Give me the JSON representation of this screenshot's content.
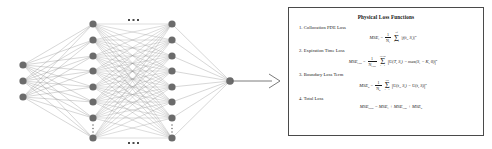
{
  "figure": {
    "caption_present": false
  },
  "network": {
    "name": "neural-network-architecture",
    "input_layer": {
      "label": "",
      "node_count": 3
    },
    "hidden_layers": [
      {
        "node_count": 8,
        "ellipsis_vertical": "⋮"
      },
      {
        "node_count": 8,
        "ellipsis_vertical": "⋮"
      }
    ],
    "hidden_ellipsis_top": "• • •",
    "hidden_ellipsis_bottom": "• • •",
    "output_layer": {
      "node_count": 1
    },
    "node_color": "#6b6b6b",
    "edge_color": "#8c8c8c",
    "arrow_color": "#5a5a5a"
  },
  "panel": {
    "title": "Physical Loss Functions",
    "border_color": "#4a4a4a",
    "items": [
      {
        "index": "1.",
        "label": "Collocation PDE Loss",
        "formula": {
          "lhs": "MSE",
          "lhs_sub": "f",
          "coef_num": "1",
          "coef_den": "N",
          "coef_den_sub": "f",
          "sum_top": "N",
          "sum_top_sub": "f",
          "sum_bot": "i = 1",
          "body": "|f(t",
          "body_sub": "i",
          "body_mid": ", S",
          "body_sub2": "i",
          "body_end": ")|",
          "power": "2"
        }
      },
      {
        "index": "2.",
        "label": "Expiration Time Loss",
        "formula": {
          "lhs": "MSE",
          "lhs_sub": "exp",
          "coef_num": "1",
          "coef_den": "N",
          "coef_den_sub": "exp",
          "sum_top": "N",
          "sum_top_sub": "exp",
          "sum_bot": "i = 1",
          "body": "U(T, S",
          "body_sub": "i",
          "body_mid": ") − max(S",
          "body_sub2": "i",
          "body_end": " − K, 0)",
          "power": "2"
        }
      },
      {
        "index": "3.",
        "label": "Boundary Loss Term",
        "formula": {
          "lhs": "MSE",
          "lhs_sub": "b",
          "coef_num": "1",
          "coef_den": "N",
          "coef_den_sub": "b",
          "sum_top": "N",
          "sum_top_sub": "b",
          "sum_bot": "i = 1",
          "body": "U(t",
          "body_sub": "i",
          "body_mid": ", S",
          "body_sub2": "i",
          "body_end": ") − U(t, S)",
          "power": "2"
        }
      },
      {
        "index": "4.",
        "label": "Total Loss",
        "formula": {
          "total": "MSE",
          "total_sub": "total",
          "eq": " = MSE",
          "t1_sub": "f",
          "plus1": " + MSE",
          "t2_sub": "exp",
          "plus2": " + MSE",
          "t3_sub": "b"
        }
      }
    ]
  }
}
